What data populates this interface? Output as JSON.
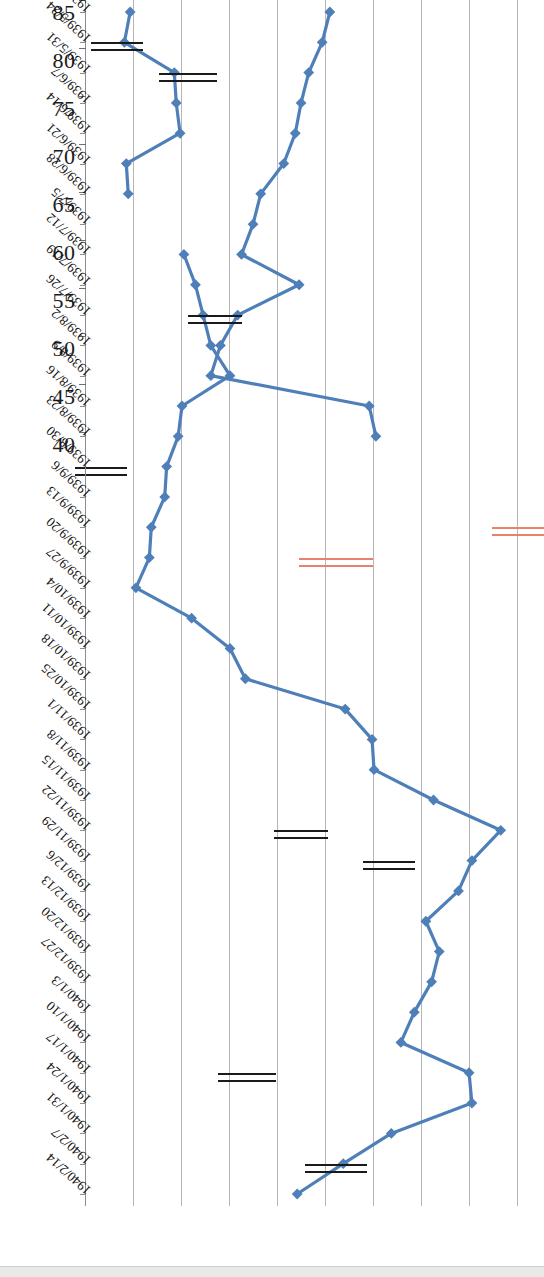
{
  "figure": {
    "orientation": "rotated-90",
    "accent_color": "#4E7FB8",
    "annotation_black": "#1A1A1A",
    "annotation_orange": "#E8836B",
    "gridline_color": "#B6B6B6"
  },
  "chart_data": {
    "type": "line",
    "title": "",
    "subtitle": "",
    "xlabel": "",
    "ylabel": "",
    "grid": true,
    "legend": "none",
    "axis_note": "Value axis is inverted: 85 at top, 40 at bottom",
    "ylim": [
      40,
      85
    ],
    "yticks": [
      85,
      80,
      75,
      70,
      65,
      60,
      55,
      50,
      45,
      40
    ],
    "ytick_labels": [
      "85",
      "80",
      "75",
      "70",
      "65",
      "60",
      "55",
      "50",
      "45",
      "40"
    ],
    "categories": [
      "1939/5/17",
      "1939/5/24",
      "1939/5/31",
      "1939/6/7",
      "1939/6/14",
      "1939/6/21",
      "1939/6/28",
      "1939/7/5",
      "1939/7/12",
      "1939/7/19",
      "1939/7/26",
      "1939/8/2",
      "1939/8/9",
      "1939/8/16",
      "1939/8/23",
      "1939/8/30",
      "1939/9/6",
      "1939/9/13",
      "1939/9/20",
      "1939/9/27",
      "1939/10/4",
      "1939/10/11",
      "1939/10/18",
      "1939/10/25",
      "1939/11/1",
      "1939/11/8",
      "1939/11/15",
      "1939/11/22",
      "1939/11/29",
      "1939/12/6",
      "1939/12/13",
      "1939/12/20",
      "1939/12/27",
      "1940/1/3",
      "1940/1/10",
      "1940/1/17",
      "1940/1/24",
      "1940/1/31",
      "1940/2/7",
      "1940/2/14"
    ],
    "series": [
      {
        "name": "price",
        "color": "#4E7FB8",
        "values": [
          44.6,
          44.0,
          49.2,
          49.4,
          49.8,
          44.2,
          44.4,
          null,
          50.2,
          51.4,
          52.2,
          53.0,
          55.0,
          50.0,
          49.6,
          48.4,
          48.2,
          46.8,
          46.6,
          45.2,
          51.0,
          55.0,
          56.6,
          67.0,
          69.8,
          70.0,
          76.2,
          83.2,
          80.2,
          78.8,
          75.4,
          76.8,
          76.0,
          74.2,
          72.8,
          79.9,
          80.2,
          71.8,
          66.8,
          62.0
        ]
      },
      {
        "name": "price-tail",
        "color": "#4E7FB8",
        "values": [
          65.4,
          64.6,
          63.2,
          62.4,
          61.8,
          60.6,
          58.2,
          57.4,
          56.2,
          62.2,
          55.8,
          54.0,
          53.0,
          69.5,
          70.2,
          null,
          null,
          null,
          null,
          null,
          null,
          null,
          null,
          null,
          null,
          null,
          null,
          null,
          null,
          null,
          null,
          null,
          null,
          null,
          null,
          null,
          null,
          null,
          null,
          null
        ]
      }
    ],
    "annotations": [
      {
        "id": "mark-1",
        "color": "#E8836B",
        "near_category": "1939/9/13",
        "near_value": 85.0,
        "span": 52
      },
      {
        "id": "mark-2",
        "color": "#E8836B",
        "near_category": "1939/9/20",
        "near_value": 66.0,
        "span": 74
      },
      {
        "id": "mark-3",
        "color": "#1A1A1A",
        "near_category": "1939/5/31",
        "near_value": 50.6,
        "span": 58
      },
      {
        "id": "mark-4",
        "color": "#1A1A1A",
        "near_category": "1939/5/24",
        "near_value": 43.2,
        "span": 52
      },
      {
        "id": "mark-5",
        "color": "#1A1A1A",
        "near_category": "1939/7/26",
        "near_value": 53.4,
        "span": 54
      },
      {
        "id": "mark-6",
        "color": "#1A1A1A",
        "near_category": "1939/8/30",
        "near_value": 41.6,
        "span": 52
      },
      {
        "id": "mark-7",
        "color": "#1A1A1A",
        "near_category": "1939/11/29",
        "near_value": 71.6,
        "span": 52
      },
      {
        "id": "mark-8",
        "color": "#1A1A1A",
        "near_category": "1939/11/22",
        "near_value": 62.4,
        "span": 54
      },
      {
        "id": "mark-9",
        "color": "#1A1A1A",
        "near_category": "1940/1/17",
        "near_value": 56.8,
        "span": 58
      },
      {
        "id": "mark-10",
        "color": "#1A1A1A",
        "near_category": "1940/2/7",
        "near_value": 66.0,
        "span": 62
      }
    ]
  }
}
